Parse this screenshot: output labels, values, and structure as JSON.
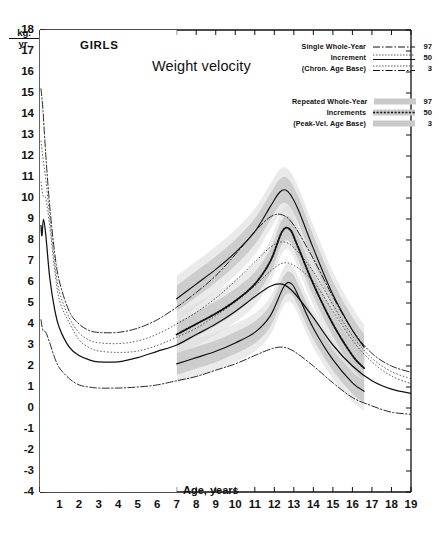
{
  "chart_data": {
    "type": "line",
    "title": "Weight velocity",
    "subject": "GIRLS",
    "xlabel": "Age, years",
    "ylabel": "kg./yr.",
    "ylabel_top": "kg.",
    "ylabel_bottom": "yr.",
    "xlim": [
      0,
      19
    ],
    "ylim": [
      -4,
      18
    ],
    "xticks": [
      0,
      1,
      2,
      3,
      4,
      5,
      6,
      7,
      8,
      9,
      10,
      11,
      12,
      13,
      14,
      15,
      16,
      17,
      18,
      19
    ],
    "xticklabels": [
      "",
      "1",
      "2",
      "3",
      "4",
      "5",
      "6",
      "7",
      "8",
      "9",
      "10",
      "11",
      "12",
      "13",
      "14",
      "15",
      "16",
      "17",
      "18",
      "19"
    ],
    "yticks": [
      -4,
      -3,
      -2,
      -1,
      0,
      1,
      2,
      3,
      4,
      5,
      6,
      7,
      8,
      9,
      10,
      11,
      12,
      13,
      14,
      15,
      16,
      17,
      18
    ],
    "yticklabels": [
      "-4",
      "-3",
      "-2",
      "-1",
      "0",
      "1",
      "2",
      "3",
      "4",
      "5",
      "6",
      "7",
      "8",
      "9",
      "10",
      "11",
      "12",
      "13",
      "14",
      "15",
      "16",
      "17",
      "18"
    ],
    "grid": false,
    "legend_position": "top-right",
    "shaded_band_start_age": 7,
    "series": [
      {
        "name": "Single Whole-Year Increment (Chron. Age Base) 97",
        "group": "single",
        "percentile": "97",
        "style": "dash-dot",
        "points": [
          [
            0.05,
            15.2
          ],
          [
            0.15,
            14.2
          ],
          [
            0.3,
            12.0
          ],
          [
            0.5,
            9.6
          ],
          [
            0.75,
            7.4
          ],
          [
            1.0,
            6.0
          ],
          [
            1.5,
            4.6
          ],
          [
            2.0,
            4.0
          ],
          [
            2.5,
            3.7
          ],
          [
            3.0,
            3.6
          ],
          [
            4.0,
            3.6
          ],
          [
            5.0,
            3.8
          ],
          [
            6.0,
            4.2
          ],
          [
            7.0,
            4.8
          ],
          [
            8.0,
            5.5
          ],
          [
            9.0,
            6.3
          ],
          [
            10.0,
            7.3
          ],
          [
            11.0,
            8.4
          ],
          [
            11.8,
            9.1
          ],
          [
            12.4,
            9.2
          ],
          [
            13.0,
            8.7
          ],
          [
            14.0,
            7.1
          ],
          [
            15.0,
            5.3
          ],
          [
            16.0,
            3.7
          ],
          [
            17.0,
            2.6
          ],
          [
            18.0,
            2.0
          ],
          [
            19.0,
            1.7
          ]
        ]
      },
      {
        "name": "Single Whole-Year Increment (Chron. Age Base) 50",
        "group": "single",
        "percentile": "50",
        "style": "solid",
        "points": [
          [
            0.05,
            8.7
          ],
          [
            0.1,
            8.2
          ],
          [
            0.18,
            9.0
          ],
          [
            0.3,
            8.2
          ],
          [
            0.5,
            6.2
          ],
          [
            0.75,
            4.7
          ],
          [
            1.0,
            3.8
          ],
          [
            1.5,
            2.9
          ],
          [
            2.0,
            2.5
          ],
          [
            2.5,
            2.3
          ],
          [
            3.0,
            2.2
          ],
          [
            4.0,
            2.2
          ],
          [
            5.0,
            2.4
          ],
          [
            6.0,
            2.7
          ],
          [
            7.0,
            3.0
          ],
          [
            8.0,
            3.5
          ],
          [
            9.0,
            4.0
          ],
          [
            10.0,
            4.6
          ],
          [
            11.0,
            5.3
          ],
          [
            11.8,
            5.8
          ],
          [
            12.4,
            5.9
          ],
          [
            13.0,
            5.5
          ],
          [
            14.0,
            4.3
          ],
          [
            15.0,
            3.0
          ],
          [
            16.0,
            2.0
          ],
          [
            17.0,
            1.3
          ],
          [
            18.0,
            0.9
          ],
          [
            19.0,
            0.7
          ]
        ]
      },
      {
        "name": "Single Whole-Year Increment (Chron. Age Base) 3",
        "group": "single",
        "percentile": "3",
        "style": "dash-dot",
        "points": [
          [
            0.05,
            4.2
          ],
          [
            0.15,
            3.7
          ],
          [
            0.3,
            3.6
          ],
          [
            0.5,
            3.1
          ],
          [
            0.75,
            2.4
          ],
          [
            1.0,
            1.9
          ],
          [
            1.5,
            1.4
          ],
          [
            2.0,
            1.1
          ],
          [
            2.5,
            1.0
          ],
          [
            3.0,
            0.95
          ],
          [
            4.0,
            0.95
          ],
          [
            5.0,
            1.0
          ],
          [
            6.0,
            1.1
          ],
          [
            7.0,
            1.3
          ],
          [
            8.0,
            1.5
          ],
          [
            9.0,
            1.8
          ],
          [
            10.0,
            2.1
          ],
          [
            11.0,
            2.5
          ],
          [
            11.8,
            2.8
          ],
          [
            12.4,
            2.9
          ],
          [
            13.0,
            2.7
          ],
          [
            14.0,
            2.0
          ],
          [
            15.0,
            1.2
          ],
          [
            16.0,
            0.5
          ],
          [
            17.0,
            0.1
          ],
          [
            18.0,
            -0.2
          ],
          [
            19.0,
            -0.3
          ]
        ]
      },
      {
        "name": "Repeated Whole-Year Increments (Peak-Vel. Age Base) 97",
        "group": "repeated",
        "percentile": "97",
        "style": "solid-shaded",
        "points": [
          [
            7.0,
            5.2
          ],
          [
            8.0,
            5.9
          ],
          [
            9.0,
            6.6
          ],
          [
            10.0,
            7.4
          ],
          [
            11.0,
            8.4
          ],
          [
            11.8,
            9.6
          ],
          [
            12.3,
            10.3
          ],
          [
            12.7,
            10.3
          ],
          [
            13.2,
            9.5
          ],
          [
            14.0,
            7.6
          ],
          [
            15.0,
            5.4
          ],
          [
            16.0,
            3.7
          ],
          [
            16.6,
            2.9
          ]
        ]
      },
      {
        "name": "Repeated Whole-Year Increments (Peak-Vel. Age Base) 50",
        "group": "repeated",
        "percentile": "50",
        "style": "dotted-heavy-shaded",
        "points": [
          [
            7.0,
            3.5
          ],
          [
            8.0,
            4.0
          ],
          [
            9.0,
            4.5
          ],
          [
            10.0,
            5.1
          ],
          [
            11.0,
            5.9
          ],
          [
            11.8,
            7.0
          ],
          [
            12.4,
            8.4
          ],
          [
            12.8,
            8.5
          ],
          [
            13.2,
            7.7
          ],
          [
            14.0,
            5.9
          ],
          [
            15.0,
            4.0
          ],
          [
            16.0,
            2.5
          ],
          [
            16.6,
            1.9
          ]
        ]
      },
      {
        "name": "Repeated Whole-Year Increments (Peak-Vel. Age Base) 3",
        "group": "repeated",
        "percentile": "3",
        "style": "solid-shaded",
        "points": [
          [
            7.0,
            2.1
          ],
          [
            8.0,
            2.4
          ],
          [
            9.0,
            2.7
          ],
          [
            10.0,
            3.1
          ],
          [
            11.0,
            3.6
          ],
          [
            11.8,
            4.4
          ],
          [
            12.5,
            5.8
          ],
          [
            12.9,
            5.9
          ],
          [
            13.3,
            5.2
          ],
          [
            14.0,
            3.8
          ],
          [
            15.0,
            2.3
          ],
          [
            16.0,
            1.2
          ],
          [
            16.6,
            0.8
          ]
        ]
      }
    ],
    "right_labels": [
      {
        "text": "97",
        "x": 17.05,
        "y": 3.0
      },
      {
        "text": "90",
        "x": 17.05,
        "y": 2.25
      },
      {
        "text": "75",
        "x": 17.05,
        "y": 1.55
      },
      {
        "text": "50",
        "x": 17.05,
        "y": 0.85
      }
    ],
    "bottom_labels": [
      {
        "text": "3",
        "x": 14.05,
        "y": 0.15
      },
      {
        "text": "10",
        "x": 14.85,
        "y": 0.15
      },
      {
        "text": "25",
        "x": 15.6,
        "y": 0.15
      },
      {
        "text": "50",
        "x": 16.5,
        "y": 0.45
      }
    ]
  },
  "legend": {
    "single": {
      "lines": [
        "Single Whole-Year",
        "Increment",
        "(Chron. Age Base)"
      ],
      "values": [
        "97",
        "50",
        "3"
      ]
    },
    "repeated": {
      "lines": [
        "Repeated Whole-Year",
        "Increments",
        "(Peak-Vel. Age Base)"
      ],
      "values": [
        "97",
        "50",
        "3"
      ]
    }
  },
  "colors": {
    "ink": "#111111",
    "band": "#c8c8c8",
    "band_light": "#dcdcdc",
    "background": "#ffffff"
  }
}
